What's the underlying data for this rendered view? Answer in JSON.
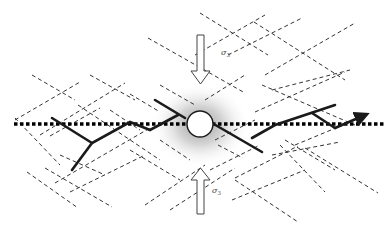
{
  "diagram": {
    "type": "fracture-network-schematic",
    "stress_labels": {
      "top": {
        "symbol": "σ",
        "subscript": "3"
      },
      "bottom": {
        "symbol": "σ",
        "subscript": "3"
      }
    },
    "elements": {
      "borehole": "white circle with grey halo at center",
      "borehole_axis": "horizontal dotted line",
      "hydraulic_fractures": "solid black polylines",
      "natural_fractures": "dashed grey line network",
      "compression_arrows": "hollow arrows pointing toward borehole from top and bottom"
    },
    "colors": {
      "background": "#ffffff",
      "solid_line": "#1a1a1a",
      "dashed_line": "#333333",
      "halo": "#9a9a9a"
    }
  }
}
